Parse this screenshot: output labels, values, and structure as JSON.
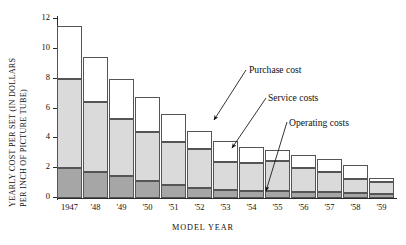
{
  "chart_data": {
    "type": "bar",
    "title": "",
    "subtitle": "",
    "xlabel": "MODEL YEAR",
    "ylabel_line1": "YEARLY COST PER SET (IN DOLLARS",
    "ylabel_line2": "PER INCH OF PICTURE TUBE)",
    "stacked": true,
    "grid": false,
    "legend_position": "annotations-with-leader-lines",
    "ylim": [
      0,
      12
    ],
    "yticks": [
      0,
      2,
      4,
      6,
      8,
      10,
      12
    ],
    "ytick_labels": [
      "0",
      "2",
      "4",
      "6",
      "8",
      "10",
      "12"
    ],
    "categories": [
      "1947",
      "'48",
      "'49",
      "'50",
      "'51",
      "'52",
      "'53",
      "'54",
      "'55",
      "'56",
      "'57",
      "'58",
      "'59"
    ],
    "series": [
      {
        "name": "Operating costs",
        "color": "#a6a6a6",
        "values": [
          2.0,
          1.75,
          1.45,
          1.15,
          0.9,
          0.65,
          0.55,
          0.5,
          0.45,
          0.4,
          0.4,
          0.35,
          0.3
        ]
      },
      {
        "name": "Service costs",
        "color": "#dadada",
        "values": [
          6.0,
          4.7,
          3.85,
          3.25,
          2.85,
          2.65,
          1.85,
          1.85,
          2.05,
          1.6,
          1.35,
          0.95,
          0.75
        ]
      },
      {
        "name": "Purchase cost",
        "color": "#ffffff",
        "values": [
          3.5,
          3.0,
          2.7,
          2.4,
          1.85,
          1.2,
          1.4,
          1.1,
          0.7,
          0.9,
          0.85,
          0.9,
          0.3
        ]
      }
    ],
    "totals": [
      11.5,
      9.45,
      8.0,
      6.8,
      5.6,
      4.5,
      3.8,
      3.45,
      3.2,
      2.9,
      2.6,
      2.2,
      1.35
    ],
    "annotations": [
      {
        "label": "Purchase cost",
        "points_to_category": "'52",
        "points_to_segment": "Purchase cost"
      },
      {
        "label": "Service costs",
        "points_to_category": "'53",
        "points_to_segment": "Service costs"
      },
      {
        "label": "Operating costs",
        "points_to_category": "'55",
        "points_to_segment": "Operating costs"
      }
    ]
  },
  "axis": {
    "x_title": "MODEL YEAR",
    "y_title_line1": "YEARLY COST PER SET (IN DOLLARS",
    "y_title_line2": "PER INCH OF PICTURE TUBE)"
  }
}
